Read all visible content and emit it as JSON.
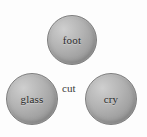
{
  "diagram": {
    "background_color": "#fdfdfd",
    "node_fill_light": "#cfcfcf",
    "node_fill_dark": "#868686",
    "node_border_color": "#7e7e7e",
    "label_color": "#2b2b2b",
    "nodes": [
      {
        "id": "foot",
        "label": "foot",
        "position": "top-center"
      },
      {
        "id": "glass",
        "label": "glass",
        "position": "bottom-left"
      },
      {
        "id": "cry",
        "label": "cry",
        "position": "bottom-right"
      }
    ],
    "free_labels": [
      {
        "id": "cut",
        "label": "cut",
        "position": "center"
      }
    ]
  }
}
